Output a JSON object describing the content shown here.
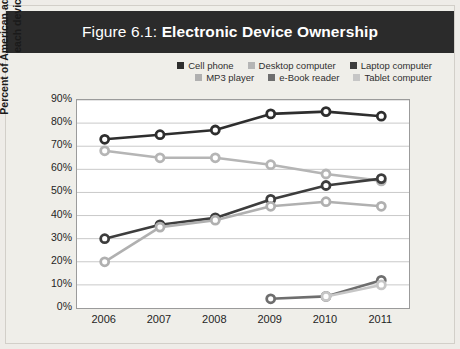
{
  "figure": {
    "title_prefix": "Figure 6.1:",
    "title_main": "Electronic Device Ownership",
    "title_bar_color": "#2b2b2b",
    "background_color": "#efeee9",
    "plot_background": "#ffffff",
    "gridline_color": "#c9c9c9",
    "axis_color": "#9b9b9b"
  },
  "chart_data": {
    "type": "line",
    "title": "Figure 6.1: Electronic Device Ownership",
    "xlabel": "",
    "ylabel": "Percent of American adults who own each device",
    "categories": [
      "2006",
      "2007",
      "2008",
      "2009",
      "2010",
      "2011"
    ],
    "x": [
      2006,
      2007,
      2008,
      2009,
      2010,
      2011
    ],
    "ylim": [
      0,
      90
    ],
    "ytick_labels": [
      "0%",
      "10%",
      "20%",
      "30%",
      "40%",
      "50%",
      "60%",
      "70%",
      "80%",
      "90%"
    ],
    "ytick_values": [
      0,
      10,
      20,
      30,
      40,
      50,
      60,
      70,
      80,
      90
    ],
    "grid": true,
    "legend_position": "top-right",
    "markers": "open-circle",
    "series": [
      {
        "name": "Cell phone",
        "color": "#2e2e2e",
        "values": [
          73,
          75,
          77,
          84,
          85,
          83
        ]
      },
      {
        "name": "Desktop computer",
        "color": "#b5b5b5",
        "values": [
          68,
          65,
          65,
          62,
          58,
          55
        ]
      },
      {
        "name": "Laptop computer",
        "color": "#3d3d3d",
        "values": [
          30,
          36,
          39,
          47,
          53,
          56
        ]
      },
      {
        "name": "MP3 player",
        "color": "#b0b0b0",
        "values": [
          20,
          35,
          38,
          44,
          46,
          44
        ]
      },
      {
        "name": "e-Book reader",
        "color": "#6e6e6e",
        "values": [
          null,
          null,
          null,
          4,
          5,
          12
        ]
      },
      {
        "name": "Tablet computer",
        "color": "#c6c6c6",
        "values": [
          null,
          null,
          null,
          null,
          5,
          10
        ]
      }
    ]
  },
  "legend": {
    "row1": [
      {
        "label": "Cell phone",
        "color": "#2e2e2e"
      },
      {
        "label": "Desktop computer",
        "color": "#b5b5b5"
      },
      {
        "label": "Laptop computer",
        "color": "#3d3d3d"
      }
    ],
    "row2": [
      {
        "label": "MP3 player",
        "color": "#b0b0b0"
      },
      {
        "label": "e-Book reader",
        "color": "#6e6e6e"
      },
      {
        "label": "Tablet computer",
        "color": "#c6c6c6"
      }
    ]
  }
}
